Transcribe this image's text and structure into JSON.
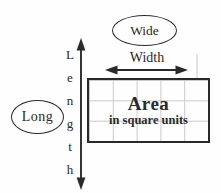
{
  "diagram": {
    "title_implicit": "Area of a rectangle diagram",
    "bubbles": {
      "wide": "Wide",
      "long": "Long"
    },
    "axis_labels": {
      "width": "Width",
      "length_letters": [
        "L",
        "e",
        "n",
        "g",
        "t",
        "h"
      ]
    },
    "rectangle": {
      "title": "Area",
      "subtitle": "in square units",
      "grid_cols": 5,
      "grid_rows": 3
    },
    "colors": {
      "ink": "#2a2a2a",
      "grid_line": "#c9c9c9",
      "background": "#fefefe"
    }
  }
}
